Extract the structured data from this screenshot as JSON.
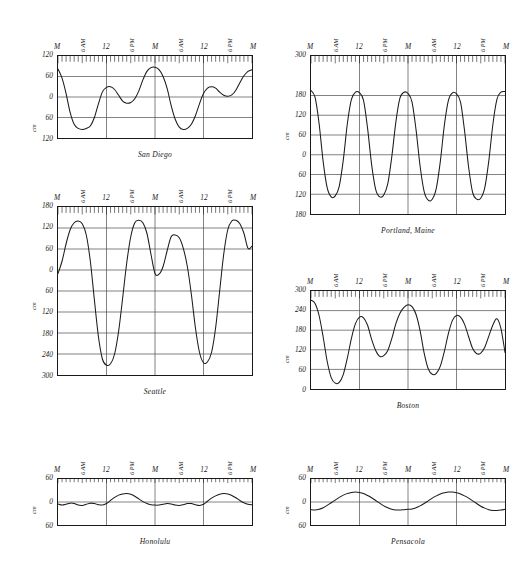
{
  "figure": {
    "type": "tide-curve-multiples",
    "panel_count": 6,
    "y_axis_title": "cm",
    "x_tick_labels": [
      "M",
      "6 AM",
      "12",
      "6 PM",
      "M",
      "6 AM",
      "12",
      "6 PM",
      "M"
    ],
    "x_span_days": 2,
    "hour_ticks": 48,
    "line_color": "#1a1a1a",
    "grid_color": "#4a4a4a",
    "frame_color": "#1a1a1a",
    "background": "#ffffff"
  },
  "chart_data": [
    {
      "type": "line",
      "title": "San Diego",
      "xlabel": "",
      "ylabel": "cm",
      "ylim": [
        -120,
        120
      ],
      "ytick_labels": [
        "120",
        "60",
        "0",
        "60",
        "120"
      ],
      "ytick_values": [
        120,
        60,
        0,
        -60,
        -120
      ],
      "xlim": [
        0,
        48
      ],
      "xtick_labels": [
        "M",
        "6 AM",
        "12",
        "6 PM",
        "M",
        "6 AM",
        "12",
        "6 PM",
        "M"
      ],
      "xtick_values": [
        0,
        6,
        12,
        18,
        24,
        30,
        36,
        42,
        48
      ],
      "grid": true,
      "tide_type": "mixed semidiurnal",
      "x": [
        0,
        1,
        2,
        3,
        4,
        5,
        6,
        7,
        8,
        9,
        10,
        11,
        12,
        13,
        14,
        15,
        16,
        17,
        18,
        19,
        20,
        21,
        22,
        23,
        24,
        25,
        26,
        27,
        28,
        29,
        30,
        31,
        32,
        33,
        34,
        35,
        36,
        37,
        38,
        39,
        40,
        41,
        42,
        43,
        44,
        45,
        46,
        47,
        48
      ],
      "values": [
        82,
        55,
        10,
        -45,
        -80,
        -92,
        -95,
        -92,
        -85,
        -60,
        -20,
        15,
        28,
        30,
        22,
        5,
        -12,
        -18,
        -16,
        -5,
        18,
        50,
        75,
        86,
        87,
        80,
        60,
        25,
        -25,
        -65,
        -88,
        -95,
        -92,
        -80,
        -55,
        -20,
        10,
        26,
        30,
        26,
        14,
        5,
        2,
        6,
        20,
        42,
        62,
        75,
        80
      ]
    },
    {
      "type": "line",
      "title": "Portland, Maine",
      "xlabel": "",
      "ylabel": "cm",
      "ylim": [
        -180,
        300
      ],
      "ytick_labels": [
        "300",
        "180",
        "120",
        "60",
        "0",
        "60",
        "120",
        "180"
      ],
      "ytick_values": [
        300,
        180,
        120,
        60,
        0,
        -60,
        -120,
        -180
      ],
      "xlim": [
        0,
        48
      ],
      "xtick_labels": [
        "M",
        "6 AM",
        "12",
        "6 PM",
        "M",
        "6 AM",
        "12",
        "6 PM",
        "M"
      ],
      "xtick_values": [
        0,
        6,
        12,
        18,
        24,
        30,
        36,
        42,
        48
      ],
      "grid": true,
      "tide_type": "semidiurnal, large range",
      "x": [
        0,
        1,
        2,
        3,
        4,
        5,
        6,
        7,
        8,
        9,
        10,
        11,
        12,
        13,
        14,
        15,
        16,
        17,
        18,
        19,
        20,
        21,
        22,
        23,
        24,
        25,
        26,
        27,
        28,
        29,
        30,
        31,
        32,
        33,
        34,
        35,
        36,
        37,
        38,
        39,
        40,
        41,
        42,
        43,
        44,
        45,
        46,
        47,
        48
      ],
      "values": [
        195,
        175,
        95,
        -20,
        -100,
        -128,
        -125,
        -95,
        -15,
        95,
        168,
        190,
        188,
        165,
        80,
        -30,
        -105,
        -128,
        -122,
        -88,
        -5,
        100,
        172,
        190,
        186,
        160,
        75,
        -35,
        -112,
        -138,
        -135,
        -102,
        -20,
        90,
        165,
        188,
        185,
        160,
        72,
        -38,
        -115,
        -135,
        -132,
        -100,
        -18,
        92,
        168,
        190,
        192
      ]
    },
    {
      "type": "line",
      "title": "Seattle",
      "xlabel": "",
      "ylabel": "cm",
      "ylim": [
        -300,
        180
      ],
      "ytick_labels": [
        "180",
        "120",
        "60",
        "0",
        "60",
        "120",
        "180",
        "240",
        "300"
      ],
      "ytick_values": [
        180,
        120,
        60,
        0,
        -60,
        -120,
        -180,
        -240,
        -300
      ],
      "xlim": [
        0,
        48
      ],
      "xtick_labels": [
        "M",
        "6 AM",
        "12",
        "6 PM",
        "M",
        "6 AM",
        "12",
        "6 PM",
        "M"
      ],
      "xtick_values": [
        0,
        6,
        12,
        18,
        24,
        30,
        36,
        42,
        48
      ],
      "grid": true,
      "tide_type": "mixed, strong diurnal inequality",
      "x": [
        0,
        1,
        2,
        3,
        4,
        5,
        6,
        7,
        8,
        9,
        10,
        11,
        12,
        13,
        14,
        15,
        16,
        17,
        18,
        19,
        20,
        21,
        22,
        23,
        24,
        25,
        26,
        27,
        28,
        29,
        30,
        31,
        32,
        33,
        34,
        35,
        36,
        37,
        38,
        39,
        40,
        41,
        42,
        43,
        44,
        45,
        46,
        47,
        48
      ],
      "values": [
        -10,
        25,
        75,
        115,
        135,
        140,
        132,
        100,
        25,
        -85,
        -190,
        -255,
        -272,
        -268,
        -240,
        -175,
        -80,
        20,
        95,
        135,
        142,
        135,
        105,
        45,
        -10,
        -12,
        10,
        55,
        95,
        100,
        92,
        62,
        10,
        -70,
        -165,
        -235,
        -265,
        -262,
        -235,
        -165,
        -60,
        45,
        115,
        140,
        142,
        132,
        105,
        62,
        68
      ]
    },
    {
      "type": "line",
      "title": "Boston",
      "xlabel": "",
      "ylabel": "cm",
      "ylim": [
        0,
        300
      ],
      "ytick_labels": [
        "300",
        "240",
        "180",
        "120",
        "60",
        "0"
      ],
      "ytick_values": [
        300,
        240,
        180,
        120,
        60,
        0
      ],
      "xlim": [
        0,
        48
      ],
      "xtick_labels": [
        "M",
        "6 AM",
        "12",
        "6 PM",
        "M",
        "6 AM",
        "12",
        "6 PM",
        "M"
      ],
      "xtick_values": [
        0,
        6,
        12,
        18,
        24,
        30,
        36,
        42,
        48
      ],
      "grid": true,
      "tide_type": "semidiurnal",
      "x": [
        0,
        1,
        2,
        3,
        4,
        5,
        6,
        7,
        8,
        9,
        10,
        11,
        12,
        13,
        14,
        15,
        16,
        17,
        18,
        19,
        20,
        21,
        22,
        23,
        24,
        25,
        26,
        27,
        28,
        29,
        30,
        31,
        32,
        33,
        34,
        35,
        36,
        37,
        38,
        39,
        40,
        41,
        42,
        43,
        44,
        45,
        46,
        47,
        48
      ],
      "values": [
        272,
        262,
        225,
        160,
        85,
        35,
        18,
        20,
        45,
        95,
        155,
        200,
        220,
        218,
        195,
        152,
        118,
        100,
        102,
        118,
        155,
        200,
        232,
        250,
        258,
        252,
        228,
        178,
        110,
        62,
        45,
        48,
        70,
        115,
        170,
        210,
        225,
        220,
        198,
        160,
        124,
        108,
        110,
        128,
        162,
        196,
        215,
        185,
        112
      ]
    },
    {
      "type": "line",
      "title": "Honolulu",
      "xlabel": "",
      "ylabel": "cm",
      "ylim": [
        -60,
        60
      ],
      "ytick_labels": [
        "60",
        "0",
        "60"
      ],
      "ytick_values": [
        60,
        0,
        -60
      ],
      "xlim": [
        0,
        48
      ],
      "xtick_labels": [
        "M",
        "6 AM",
        "12",
        "6 PM",
        "M",
        "6 AM",
        "12",
        "6 PM",
        "M"
      ],
      "xtick_values": [
        0,
        6,
        12,
        18,
        24,
        30,
        36,
        42,
        48
      ],
      "grid": true,
      "tide_type": "mixed, small range",
      "x": [
        0,
        1,
        2,
        3,
        4,
        5,
        6,
        7,
        8,
        9,
        10,
        11,
        12,
        13,
        14,
        15,
        16,
        17,
        18,
        19,
        20,
        21,
        22,
        23,
        24,
        25,
        26,
        27,
        28,
        29,
        30,
        31,
        32,
        33,
        34,
        35,
        36,
        37,
        38,
        39,
        40,
        41,
        42,
        43,
        44,
        45,
        46,
        47,
        48
      ],
      "values": [
        -5,
        -8,
        -6,
        -3,
        -4,
        -8,
        -9,
        -6,
        -3,
        -4,
        -7,
        -8,
        -4,
        4,
        12,
        18,
        21,
        22,
        20,
        15,
        8,
        1,
        -4,
        -7,
        -8,
        -8,
        -6,
        -4,
        -5,
        -8,
        -9,
        -7,
        -4,
        -4,
        -7,
        -9,
        -6,
        2,
        10,
        16,
        20,
        22,
        21,
        17,
        11,
        4,
        -2,
        -6,
        -7
      ]
    },
    {
      "type": "line",
      "title": "Pensacola",
      "xlabel": "",
      "ylabel": "cm",
      "ylim": [
        -60,
        60
      ],
      "ytick_labels": [
        "60",
        "0",
        "60"
      ],
      "ytick_values": [
        60,
        0,
        -60
      ],
      "xlim": [
        0,
        48
      ],
      "xtick_labels": [
        "M",
        "6 AM",
        "12",
        "6 PM",
        "M",
        "6 AM",
        "12",
        "6 PM",
        "M"
      ],
      "xtick_values": [
        0,
        6,
        12,
        18,
        24,
        30,
        36,
        42,
        48
      ],
      "grid": true,
      "tide_type": "diurnal",
      "x": [
        0,
        1,
        2,
        3,
        4,
        5,
        6,
        7,
        8,
        9,
        10,
        11,
        12,
        13,
        14,
        15,
        16,
        17,
        18,
        19,
        20,
        21,
        22,
        23,
        24,
        25,
        26,
        27,
        28,
        29,
        30,
        31,
        32,
        33,
        34,
        35,
        36,
        37,
        38,
        39,
        40,
        41,
        42,
        43,
        44,
        45,
        46,
        47,
        48
      ],
      "values": [
        -20,
        -21,
        -19,
        -15,
        -9,
        -2,
        5,
        12,
        18,
        22,
        25,
        26,
        25,
        22,
        17,
        11,
        4,
        -3,
        -10,
        -15,
        -19,
        -21,
        -21,
        -20,
        -19,
        -18,
        -15,
        -10,
        -4,
        3,
        10,
        16,
        21,
        24,
        26,
        26,
        24,
        21,
        16,
        10,
        3,
        -4,
        -11,
        -16,
        -20,
        -22,
        -22,
        -21,
        -19
      ]
    }
  ]
}
